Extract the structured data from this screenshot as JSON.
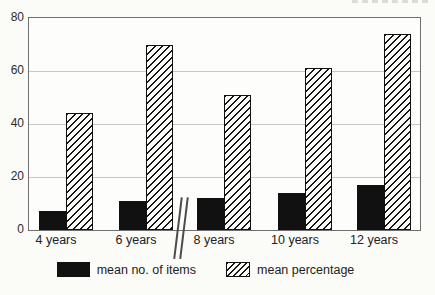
{
  "chart_data": {
    "type": "bar",
    "title": "",
    "categories": [
      "4 years",
      "6 years",
      "8 years",
      "10 years",
      "12 years"
    ],
    "series": [
      {
        "name": "mean no. of items",
        "style": "solid-black",
        "values": [
          7,
          11,
          12,
          14,
          17
        ]
      },
      {
        "name": "mean percentage",
        "style": "diagonal-hatch",
        "values": [
          44,
          70,
          51,
          61,
          74
        ]
      }
    ],
    "xlabel": "",
    "ylabel": "",
    "ylim": [
      0,
      80
    ],
    "yticks": [
      0,
      20,
      40,
      60,
      80
    ],
    "grid": "horizontal",
    "legend_position": "bottom",
    "axis_break": {
      "between": [
        "6 years",
        "8 years"
      ],
      "symbol": "double-slash"
    }
  },
  "legend": {
    "items": [
      {
        "label": "mean no. of items",
        "swatch": "solid-black"
      },
      {
        "label": "mean percentage",
        "swatch": "diagonal-hatch"
      }
    ]
  },
  "colors": {
    "bar_solid": "#111111",
    "hatch_line": "#161616",
    "frame": "#6f6f6f",
    "gridline": "#c7c7c3",
    "background": "#fbfbf8",
    "text": "#222222"
  }
}
